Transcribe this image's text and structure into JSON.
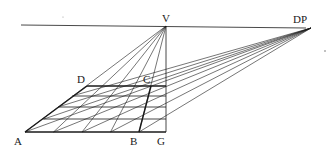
{
  "diagram": {
    "labels": {
      "V": "V",
      "DP": "DP",
      "A": "A",
      "B": "B",
      "C": "C",
      "D": "D",
      "G": "G"
    },
    "points": {
      "V": [
        166,
        26
      ],
      "DP": [
        311,
        28
      ],
      "A": [
        25,
        132
      ],
      "B": [
        139,
        132
      ],
      "G": [
        166,
        132
      ],
      "D": [
        87,
        86
      ],
      "C": [
        151,
        86
      ]
    },
    "horizon": {
      "x1": 21,
      "y1": 25,
      "x2": 306,
      "y2": 28
    },
    "grid": {
      "rows_y": [
        86,
        96,
        107,
        119,
        132
      ],
      "columns": 4,
      "diagonals_to": "DP"
    },
    "colors": {
      "ink": "#1a1a1a",
      "background": "#ffffff"
    }
  }
}
